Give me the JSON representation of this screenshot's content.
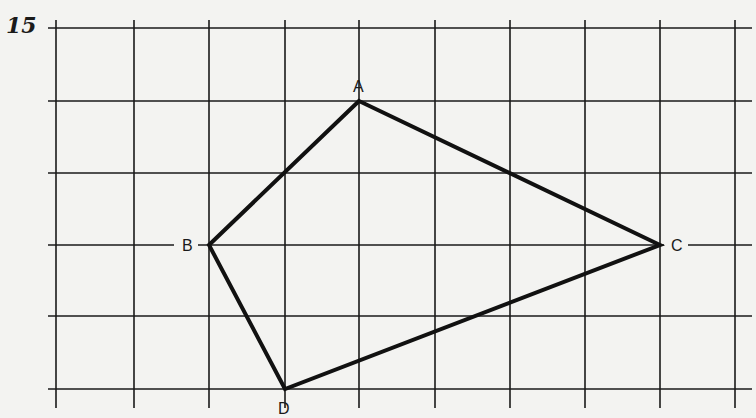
{
  "problem_number": "15",
  "grid": {
    "vertical_x": [
      56,
      134,
      209,
      285,
      359,
      435,
      510,
      585,
      660,
      735
    ],
    "horizontal_y": [
      28,
      101,
      173,
      245,
      316,
      389
    ],
    "x_extent": [
      48,
      752
    ],
    "y_extent": [
      20,
      408
    ],
    "line_color": "#1a1a1a"
  },
  "shape": {
    "type": "quadrilateral",
    "stroke_color": "#111111",
    "vertices": [
      {
        "label": "A",
        "x": 359,
        "y": 101,
        "grid_col": 4,
        "grid_row": 1
      },
      {
        "label": "C",
        "x": 660,
        "y": 245,
        "grid_col": 8,
        "grid_row": 3
      },
      {
        "label": "D",
        "x": 285,
        "y": 389,
        "grid_col": 3,
        "grid_row": 5
      },
      {
        "label": "B",
        "x": 209,
        "y": 245,
        "grid_col": 2,
        "grid_row": 3
      }
    ]
  },
  "labels": {
    "A": {
      "text": "A",
      "x": 353,
      "y": 92
    },
    "B": {
      "text": "B",
      "x": 182,
      "y": 251
    },
    "C": {
      "text": "C",
      "x": 671,
      "y": 251
    },
    "D": {
      "text": "D",
      "x": 278,
      "y": 414
    }
  }
}
